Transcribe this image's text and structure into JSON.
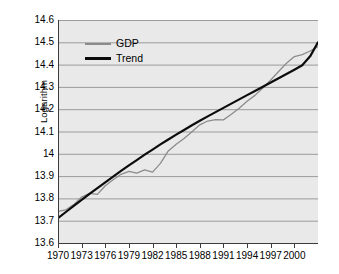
{
  "chart_data": {
    "type": "line",
    "title": "",
    "xlabel": "",
    "ylabel": "Logarithm",
    "xlim": [
      1970,
      2003
    ],
    "ylim": [
      13.6,
      14.6
    ],
    "grid": true,
    "legend_position": "top-left-inside",
    "x_tick_labels": [
      "1970",
      "1973",
      "1976",
      "1979",
      "1982",
      "1985",
      "1988",
      "1991",
      "1994",
      "1997",
      "2000"
    ],
    "x_tick_values": [
      1970,
      1973,
      1976,
      1979,
      1982,
      1985,
      1988,
      1991,
      1994,
      1997,
      2000
    ],
    "y_tick_labels": [
      "14.6",
      "14.5",
      "14.4",
      "14.3",
      "14.2",
      "14.1",
      "14",
      "13.9",
      "13.8",
      "13.7",
      "13.6"
    ],
    "y_tick_values": [
      14.6,
      14.5,
      14.4,
      14.3,
      14.2,
      14.1,
      14.0,
      13.9,
      13.8,
      13.7,
      13.6
    ],
    "colors": {
      "gdp": "#8c8c8c",
      "trend": "#0c0c0c",
      "plot_background": "#e9e9e9",
      "gridline": "#9b9b9b",
      "axis": "#3c3c3c",
      "figure_background": "#ffffff"
    },
    "x": [
      1970,
      1971,
      1972,
      1973,
      1974,
      1975,
      1976,
      1977,
      1978,
      1979,
      1980,
      1981,
      1982,
      1983,
      1984,
      1985,
      1986,
      1987,
      1988,
      1989,
      1990,
      1991,
      1992,
      1993,
      1994,
      1995,
      1996,
      1997,
      1998,
      1999,
      2000,
      2001,
      2002,
      2003
    ],
    "series": [
      {
        "name": "GDP",
        "color": "#8c8c8c",
        "values": [
          13.742,
          13.749,
          13.772,
          13.806,
          13.823,
          13.818,
          13.857,
          13.884,
          13.908,
          13.921,
          13.913,
          13.928,
          13.918,
          13.957,
          14.013,
          14.043,
          14.069,
          14.099,
          14.13,
          14.147,
          14.153,
          14.152,
          14.177,
          14.204,
          14.236,
          14.262,
          14.295,
          14.331,
          14.369,
          14.406,
          14.436,
          14.445,
          14.461,
          14.481
        ]
      },
      {
        "name": "Trend",
        "color": "#0c0c0c",
        "values": [
          13.712,
          13.739,
          13.766,
          13.793,
          13.82,
          13.846,
          13.872,
          13.898,
          13.923,
          13.948,
          13.972,
          13.996,
          14.019,
          14.042,
          14.064,
          14.086,
          14.107,
          14.128,
          14.148,
          14.168,
          14.187,
          14.206,
          14.225,
          14.244,
          14.263,
          14.282,
          14.301,
          14.32,
          14.339,
          14.358,
          14.377,
          14.397,
          14.437,
          14.5
        ]
      }
    ],
    "legend": [
      {
        "label": "GDP",
        "color": "#8c8c8c",
        "style": "thin-gray"
      },
      {
        "label": "Trend",
        "color": "#0c0c0c",
        "style": "thick-black"
      }
    ]
  }
}
